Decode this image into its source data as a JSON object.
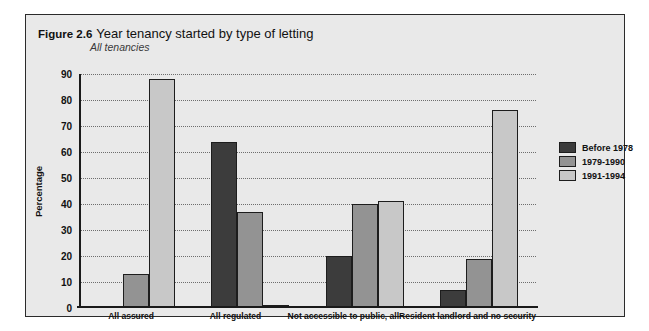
{
  "figure": {
    "number": "Figure 2.6",
    "title": "Year tenancy started by type of letting",
    "subtitle": "All tenancies"
  },
  "chart_data": {
    "type": "bar",
    "title": "Year tenancy started by type of letting",
    "subtitle": "All tenancies",
    "xlabel": "",
    "ylabel": "Percentage",
    "ylim": [
      0,
      90
    ],
    "yticks": [
      0,
      10,
      20,
      30,
      40,
      50,
      60,
      70,
      80,
      90
    ],
    "grid": true,
    "legend_position": "right",
    "categories": [
      "All assured",
      "All regulated",
      "Not accessible to public, all",
      "Resident landlord and no security"
    ],
    "series": [
      {
        "name": "Before 1978",
        "color": "#3c3c3c",
        "values": [
          0,
          64,
          20,
          7
        ]
      },
      {
        "name": "1979-1990",
        "color": "#939393",
        "values": [
          13,
          37,
          40,
          19
        ]
      },
      {
        "name": "1991-1994",
        "color": "#c8c8c8",
        "values": [
          88,
          1,
          41,
          76
        ]
      }
    ]
  }
}
